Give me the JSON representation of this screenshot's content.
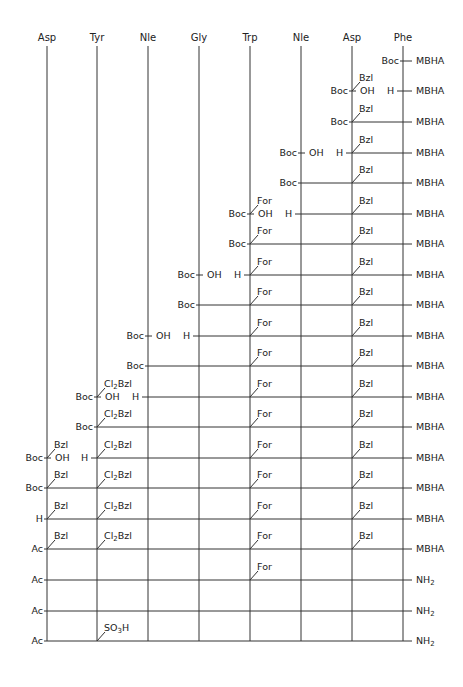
{
  "columns": [
    {
      "name": "Asp",
      "x": 47
    },
    {
      "name": "Tyr",
      "x": 97
    },
    {
      "name": "Nle",
      "x": 148
    },
    {
      "name": "Gly",
      "x": 199
    },
    {
      "name": "Trp",
      "x": 250
    },
    {
      "name": "Nle",
      "x": 301
    },
    {
      "name": "Asp",
      "x": 352
    },
    {
      "name": "Phe",
      "x": 403
    }
  ],
  "line_color": "#333333",
  "rows": [
    {
      "y": 61,
      "start": 403,
      "left": "Boc",
      "resin": "MBHA",
      "coupling": null,
      "side": []
    },
    {
      "y": 91,
      "start": 352,
      "left": "Boc",
      "resin": "MBHA",
      "coupling": {
        "col": 352,
        "h_col": 403
      },
      "side": [
        {
          "col": 352,
          "text": "Bzl"
        }
      ]
    },
    {
      "y": 122,
      "start": 352,
      "left": "Boc",
      "resin": "MBHA",
      "coupling": null,
      "side": [
        {
          "col": 352,
          "text": "Bzl"
        }
      ]
    },
    {
      "y": 153,
      "start": 301,
      "left": "Boc",
      "resin": "MBHA",
      "coupling": {
        "col": 301,
        "h_col": 352
      },
      "side": [
        {
          "col": 352,
          "text": "Bzl"
        }
      ]
    },
    {
      "y": 183,
      "start": 301,
      "left": "Boc",
      "resin": "MBHA",
      "coupling": null,
      "side": [
        {
          "col": 352,
          "text": "Bzl"
        }
      ]
    },
    {
      "y": 214,
      "start": 250,
      "left": "Boc",
      "resin": "MBHA",
      "coupling": {
        "col": 250,
        "h_col": 301
      },
      "side": [
        {
          "col": 250,
          "text": "For"
        },
        {
          "col": 352,
          "text": "Bzl"
        }
      ]
    },
    {
      "y": 244,
      "start": 250,
      "left": "Boc",
      "resin": "MBHA",
      "coupling": null,
      "side": [
        {
          "col": 250,
          "text": "For"
        },
        {
          "col": 352,
          "text": "Bzl"
        }
      ]
    },
    {
      "y": 275,
      "start": 199,
      "left": "Boc",
      "resin": "MBHA",
      "coupling": {
        "col": 199,
        "h_col": 250
      },
      "side": [
        {
          "col": 250,
          "text": "For"
        },
        {
          "col": 352,
          "text": "Bzl"
        }
      ]
    },
    {
      "y": 305,
      "start": 199,
      "left": "Boc",
      "resin": "MBHA",
      "coupling": null,
      "side": [
        {
          "col": 250,
          "text": "For"
        },
        {
          "col": 352,
          "text": "Bzl"
        }
      ]
    },
    {
      "y": 336,
      "start": 148,
      "left": "Boc",
      "resin": "MBHA",
      "coupling": {
        "col": 148,
        "h_col": 199
      },
      "side": [
        {
          "col": 250,
          "text": "For"
        },
        {
          "col": 352,
          "text": "Bzl"
        }
      ]
    },
    {
      "y": 366,
      "start": 148,
      "left": "Boc",
      "resin": "MBHA",
      "coupling": null,
      "side": [
        {
          "col": 250,
          "text": "For"
        },
        {
          "col": 352,
          "text": "Bzl"
        }
      ]
    },
    {
      "y": 397,
      "start": 97,
      "left": "Boc",
      "resin": "MBHA",
      "coupling": {
        "col": 97,
        "h_col": 148
      },
      "side": [
        {
          "col": 97,
          "text": "Cl2Bzl"
        },
        {
          "col": 250,
          "text": "For"
        },
        {
          "col": 352,
          "text": "Bzl"
        }
      ]
    },
    {
      "y": 427,
      "start": 97,
      "left": "Boc",
      "resin": "MBHA",
      "coupling": null,
      "side": [
        {
          "col": 97,
          "text": "Cl2Bzl"
        },
        {
          "col": 250,
          "text": "For"
        },
        {
          "col": 352,
          "text": "Bzl"
        }
      ]
    },
    {
      "y": 458,
      "start": 47,
      "left": "Boc",
      "resin": "MBHA",
      "coupling": {
        "col": 47,
        "h_col": 97
      },
      "side": [
        {
          "col": 47,
          "text": "Bzl"
        },
        {
          "col": 97,
          "text": "Cl2Bzl"
        },
        {
          "col": 250,
          "text": "For"
        },
        {
          "col": 352,
          "text": "Bzl"
        }
      ]
    },
    {
      "y": 488,
      "start": 47,
      "left": "Boc",
      "resin": "MBHA",
      "coupling": null,
      "side": [
        {
          "col": 47,
          "text": "Bzl"
        },
        {
          "col": 97,
          "text": "Cl2Bzl"
        },
        {
          "col": 250,
          "text": "For"
        },
        {
          "col": 352,
          "text": "Bzl"
        }
      ]
    },
    {
      "y": 519,
      "start": 47,
      "left": "H",
      "resin": "MBHA",
      "coupling": null,
      "side": [
        {
          "col": 47,
          "text": "Bzl"
        },
        {
          "col": 97,
          "text": "Cl2Bzl"
        },
        {
          "col": 250,
          "text": "For"
        },
        {
          "col": 352,
          "text": "Bzl"
        }
      ]
    },
    {
      "y": 549,
      "start": 47,
      "left": "Ac",
      "resin": "MBHA",
      "coupling": null,
      "side": [
        {
          "col": 47,
          "text": "Bzl"
        },
        {
          "col": 97,
          "text": "Cl2Bzl"
        },
        {
          "col": 250,
          "text": "For"
        },
        {
          "col": 352,
          "text": "Bzl"
        }
      ]
    },
    {
      "y": 580,
      "start": 47,
      "left": "Ac",
      "resin": "NH2",
      "coupling": null,
      "side": [
        {
          "col": 250,
          "text": "For"
        }
      ]
    },
    {
      "y": 611,
      "start": 47,
      "left": "Ac",
      "resin": "NH2",
      "coupling": null,
      "side": []
    },
    {
      "y": 641,
      "start": 47,
      "left": "Ac",
      "resin": "NH2",
      "coupling": null,
      "side": [
        {
          "col": 97,
          "text": "SO3H"
        }
      ]
    }
  ],
  "labels": {
    "oh": "OH",
    "h": "H"
  },
  "column_top": 46,
  "column_bottom": 641,
  "resin_line_end": 412
}
